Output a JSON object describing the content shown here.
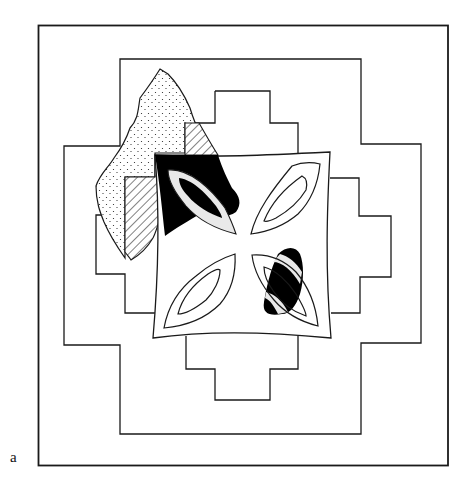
{
  "figure": {
    "panel_label": "a",
    "colors": {
      "line": "#1a1a1a",
      "fill_solid": "#000000",
      "background": "#ffffff"
    },
    "elements": [
      {
        "name": "outer-frame",
        "kind": "rectangle"
      },
      {
        "name": "outer-stepped-cross",
        "kind": "stepped outline"
      },
      {
        "name": "inner-stepped-cross",
        "kind": "stepped outline"
      },
      {
        "name": "stippled-region",
        "kind": "irregular stippled shape"
      },
      {
        "name": "hatched-region",
        "kind": "diagonal hatched shape"
      },
      {
        "name": "central-square",
        "kind": "curved-edge square with four leaf motifs"
      },
      {
        "name": "black-overlay-upper-left",
        "kind": "solid black region"
      },
      {
        "name": "black-overlay-lower-right",
        "kind": "solid black region"
      }
    ]
  }
}
